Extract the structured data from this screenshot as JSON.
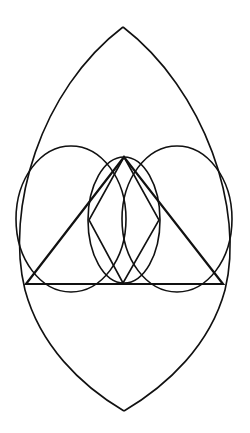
{
  "diagram": {
    "title": "",
    "stroke_color": "#111111",
    "background_color": "#ffffff",
    "elements": [
      {
        "name": "vesica-outline",
        "kind": "pointed-oval"
      },
      {
        "name": "left-circle",
        "kind": "circle"
      },
      {
        "name": "right-circle",
        "kind": "circle"
      },
      {
        "name": "center-circle",
        "kind": "circle"
      },
      {
        "name": "triangle",
        "kind": "triangle"
      },
      {
        "name": "rhombus",
        "kind": "rhombus"
      }
    ]
  }
}
